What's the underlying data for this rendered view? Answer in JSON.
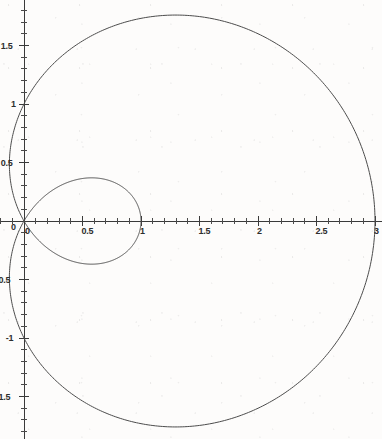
{
  "chart_data": {
    "type": "line",
    "title": "",
    "subtitle": "",
    "xlabel": "",
    "ylabel": "",
    "grid": false,
    "legend": false,
    "legend_position": "none",
    "plot_style": "polar curve drawn on cartesian axes",
    "equation": "r = 1 + 2*cos(theta)",
    "curve_name": "limacon with inner loop",
    "xlim": [
      -0.21,
      3.06
    ],
    "ylim": [
      -1.86,
      1.9
    ],
    "x_ticks_major": [
      0,
      0.5,
      1,
      1.5,
      2,
      2.5,
      3
    ],
    "x_tick_labels": [
      "0",
      "0.5",
      "1",
      "1.5",
      "2",
      "2.5",
      "3"
    ],
    "y_ticks_major": [
      1.5,
      1,
      0.5,
      0,
      -0.5,
      -1,
      -1.5
    ],
    "y_tick_labels": [
      "1.5",
      "1",
      "0.5",
      "0",
      "-0.5",
      "-1",
      "-1.5"
    ],
    "minor_tick_interval": 0.1,
    "axis_color": "#3a3a3a",
    "curve_color": "#4c4c4c",
    "background_color": "#fdfcfb",
    "series": [
      {
        "name": "outer loop",
        "theta_range_deg": [
          -120,
          120
        ],
        "description": "outer branch of r = 1 + 2 cos(theta), crosses x-axis at x = 3, reaches y max ~1.73 and y min ~-1.73, leftmost x ~ -0.125",
        "key_points": [
          {
            "theta_deg": 0,
            "r": 3,
            "x": 3,
            "y": 0
          },
          {
            "theta_deg": 30,
            "r": 2.732,
            "x": 2.366,
            "y": 1.366
          },
          {
            "theta_deg": 60,
            "r": 2,
            "x": 1,
            "y": 1.732
          },
          {
            "theta_deg": 90,
            "r": 1,
            "x": 0,
            "y": 1
          },
          {
            "theta_deg": 110,
            "r": 0.316,
            "x": -0.108,
            "y": 0.297
          },
          {
            "theta_deg": 120,
            "r": 0,
            "x": 0,
            "y": 0
          },
          {
            "theta_deg": -60,
            "r": 2,
            "x": 1,
            "y": -1.732
          },
          {
            "theta_deg": -90,
            "r": 1,
            "x": 0,
            "y": -1
          },
          {
            "theta_deg": -120,
            "r": 0,
            "x": 0,
            "y": 0
          }
        ]
      },
      {
        "name": "inner loop",
        "theta_range_deg": [
          120,
          240
        ],
        "description": "inner loop of r = 1 + 2 cos(theta) where r is negative, spans x from 0 to 1",
        "key_points": [
          {
            "theta_deg": 120,
            "r": 0,
            "x": 0,
            "y": 0
          },
          {
            "theta_deg": 150,
            "r": -0.732,
            "x": 0.634,
            "y": 0.366
          },
          {
            "theta_deg": 180,
            "r": -1,
            "x": 1,
            "y": 0
          },
          {
            "theta_deg": 210,
            "r": -0.732,
            "x": 0.634,
            "y": -0.366
          },
          {
            "theta_deg": 240,
            "r": 0,
            "x": 0,
            "y": 0
          }
        ]
      }
    ],
    "annotations": []
  }
}
